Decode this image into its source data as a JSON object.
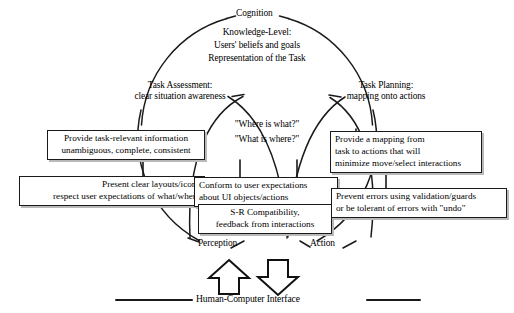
{
  "diagram": {
    "nodes": {
      "cognition": "Cognition",
      "knowledge_level": [
        "Knowledge-Level:",
        "Users' beliefs and goals",
        "Representation of the Task"
      ],
      "task_assessment": [
        "Task Assessment:",
        "clear situation awareness"
      ],
      "task_planning": [
        "Task Planning:",
        "mapping onto actions"
      ],
      "questions": [
        "\"Where is what?\"",
        "\"What is where?\""
      ],
      "perception": "Perception",
      "action": "Action",
      "interface": "Human-Computer Interface"
    },
    "boxes": {
      "task_relevant_info": [
        "Provide task-relevant information",
        "unambiguous, complete, consistent"
      ],
      "clear_layouts": [
        "Present clear layouts/icons",
        "respect user expectations of what/where"
      ],
      "conform_expectations": [
        "Conform to user expectations",
        "about UI objects/actions"
      ],
      "sr_compatibility": [
        "S-R Compatibility,",
        "feedback from interactions"
      ],
      "mapping_task_actions": [
        "Provide a mapping from",
        "task to actions that will",
        "minimize move/select interactions"
      ],
      "prevent_errors": [
        "Prevent errors using validation/guards",
        "or be tolerant of errors with \"undo\""
      ]
    },
    "arrows": {
      "perception_arrow": "arrow-up",
      "action_arrow": "arrow-down"
    },
    "colors": {
      "stroke": "#1a1a1a",
      "box_shadow": "#b9b9b9",
      "background": "#ffffff"
    }
  }
}
